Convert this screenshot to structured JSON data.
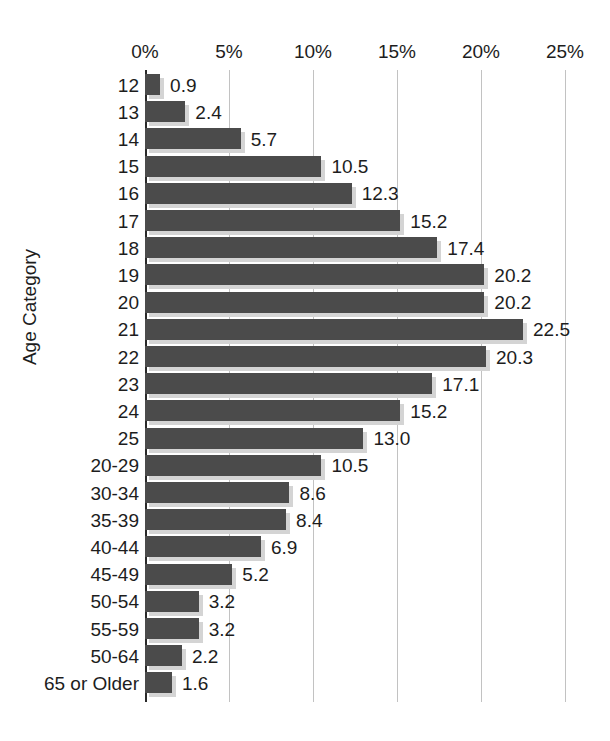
{
  "chart_data": {
    "type": "bar",
    "orientation": "horizontal",
    "title": "",
    "xlabel": "",
    "ylabel": "Age Category",
    "xlim": [
      0,
      25
    ],
    "xtick_labels": [
      "0%",
      "5%",
      "10%",
      "15%",
      "20%",
      "25%"
    ],
    "xtick_values": [
      0,
      5,
      10,
      15,
      20,
      25
    ],
    "grid": true,
    "legend": false,
    "bar_color": "#4b4b4b",
    "shadow_color": "#d4d4d4",
    "axis_color": "#2a2a2a",
    "gridline_color": "#c2c2c2",
    "categories": [
      "12",
      "13",
      "14",
      "15",
      "16",
      "17",
      "18",
      "19",
      "20",
      "21",
      "22",
      "23",
      "24",
      "25",
      "20-29",
      "30-34",
      "35-39",
      "40-44",
      "45-49",
      "50-54",
      "55-59",
      "50-64",
      "65 or Older"
    ],
    "values": [
      0.9,
      2.4,
      5.7,
      10.5,
      12.3,
      15.2,
      17.4,
      20.2,
      20.2,
      22.5,
      20.3,
      17.1,
      15.2,
      13.0,
      10.5,
      8.6,
      8.4,
      6.9,
      5.2,
      3.2,
      3.2,
      2.2,
      1.6
    ],
    "value_labels": [
      "0.9",
      "2.4",
      "5.7",
      "10.5",
      "12.3",
      "15.2",
      "17.4",
      "20.2",
      "20.2",
      "22.5",
      "20.3",
      "17.1",
      "15.2",
      "13.0",
      "10.5",
      "8.6",
      "8.4",
      "6.9",
      "5.2",
      "3.2",
      "3.2",
      "2.2",
      "1.6"
    ]
  },
  "clipped": {
    "top_strip": "",
    "bottom_strip": ""
  }
}
